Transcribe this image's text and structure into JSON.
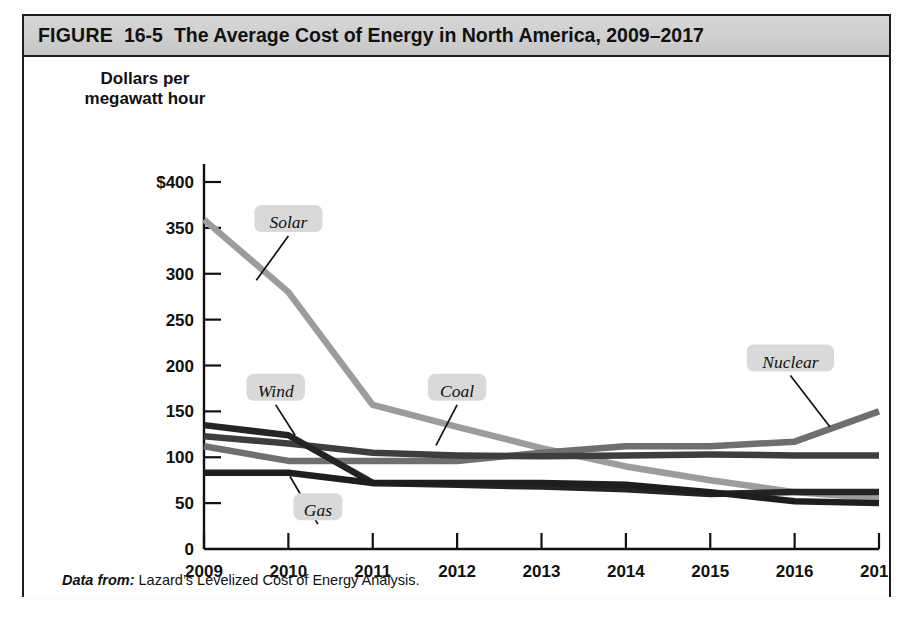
{
  "figure": {
    "label": "FIGURE",
    "number": "16-5",
    "title": "The Average Cost of Energy in North America, 2009–2017",
    "source_prefix": "Data from:",
    "source_text": "Lazard’s Levelized Cost of Energy Analysis."
  },
  "bleed_text": {
    "block_a": "    ull the country  nd the\n   ceptable to consumers, a\n     te to supply base load\n     ng the fraction of time\n     e renewable generation\n       at the same time, a\n    ch is also used to only\n      ld be a problem that\n     solar or wind has this\n     nt, or about 4% of its\n       nsive option. As it\n      is about equal to that\n       energy is about 25%",
    "block_b": "e Chanqi"
  },
  "chart_data": {
    "type": "line",
    "title": "The Average Cost of Energy in North America, 2009–2017",
    "xlabel": "Year",
    "ylabel": "Dollars per megawatt hour",
    "x": [
      2009,
      2010,
      2011,
      2012,
      2013,
      2014,
      2015,
      2016,
      2017
    ],
    "xtick_labels": [
      "2009",
      "2010",
      "2011",
      "2012",
      "2013",
      "2014",
      "2015",
      "2016",
      "2017"
    ],
    "ytick_labels": [
      "0",
      "50",
      "100",
      "150",
      "200",
      "250",
      "300",
      "350",
      "$400"
    ],
    "yticks": [
      0,
      50,
      100,
      150,
      200,
      250,
      300,
      350,
      400
    ],
    "ylim": [
      0,
      400
    ],
    "xlim": [
      2009,
      2017
    ],
    "grid": false,
    "legend": "inline-labels",
    "series": [
      {
        "name": "Solar",
        "color": "#9c9c9c",
        "values": [
          359,
          280,
          157,
          133,
          110,
          90,
          75,
          62,
          55
        ],
        "label_x": 2010.0,
        "label_y": 352,
        "leader_to_x": 2009.62,
        "leader_to_y": 293
      },
      {
        "name": "Wind",
        "color": "#242424",
        "values": [
          135,
          124,
          72,
          70,
          68,
          65,
          60,
          62,
          62
        ],
        "label_x": 2009.85,
        "label_y": 168,
        "leader_to_x": 2010.08,
        "leader_to_y": 124
      },
      {
        "name": "Coal",
        "color": "#3e3e3e",
        "values": [
          123,
          115,
          105,
          102,
          101,
          102,
          103,
          102,
          102
        ],
        "label_x": 2012.0,
        "label_y": 168,
        "leader_to_x": 2011.75,
        "leader_to_y": 113
      },
      {
        "name": "Nuclear",
        "color": "#6f6f6f",
        "values": [
          112,
          96,
          96,
          96,
          105,
          112,
          112,
          117,
          150
        ],
        "label_x": 2015.95,
        "label_y": 200,
        "leader_to_x": 2016.42,
        "leader_to_y": 133
      },
      {
        "name": "Gas",
        "color": "#1e1e1e",
        "values": [
          83,
          83,
          72,
          72,
          72,
          70,
          62,
          52,
          50
        ],
        "label_x": 2010.35,
        "label_y": 38,
        "leader_to_x": 2010.02,
        "leader_to_y": 79
      }
    ]
  }
}
